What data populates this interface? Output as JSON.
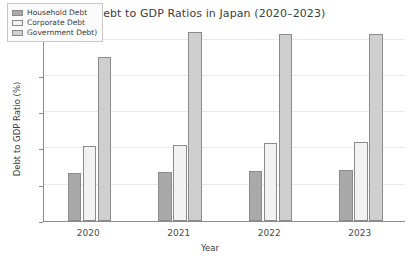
{
  "chart_data": {
    "type": "bar",
    "title": "Debt to GDP Ratios in Japan (2020–2023)",
    "xlabel": "Year",
    "ylabel": "Debt to GDP Ratio (%)",
    "categories": [
      "2020",
      "2021",
      "2022",
      "2023"
    ],
    "series": [
      {
        "name": "Household Debt",
        "color": "#a9a9a9",
        "values": [
          66,
          67,
          69,
          70
        ]
      },
      {
        "name": "Corporate Debt",
        "color": "#f2f2f2",
        "values": [
          103,
          105,
          108,
          109
        ]
      },
      {
        "name": "Government Debt)",
        "color": "#cfcfcf",
        "values": [
          226,
          261,
          257,
          258
        ]
      }
    ],
    "ylim": [
      0,
      270
    ],
    "yticks": [
      0,
      50,
      100,
      150,
      200,
      250
    ],
    "ytick_labels": [
      "0",
      "50",
      "100",
      "150",
      "200",
      "250"
    ],
    "grid": true,
    "legend_position": "upper left"
  }
}
